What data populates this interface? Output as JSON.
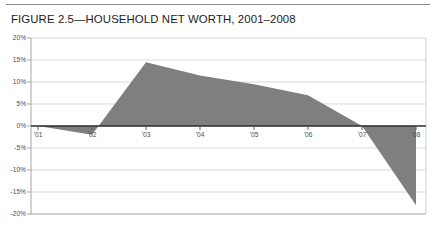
{
  "figure": {
    "title": "FIGURE 2.5—HOUSEHOLD NET WORTH, 2001–2008"
  },
  "colors": {
    "area_fill": "#7f7f7f",
    "zero_axis": "#2b2b2b",
    "gridline": "#d9d9d9",
    "axis_line": "#a6a6a6",
    "tick_text": "#4d4d4d",
    "title_text": "#1b1b1b",
    "top_rule": "#8a8a8a"
  },
  "chart_data": {
    "type": "area",
    "title": "FIGURE 2.5—HOUSEHOLD NET WORTH, 2001–2008",
    "xlabel": "",
    "ylabel": "",
    "grid": true,
    "legend": "none",
    "xlim": [
      "'01",
      "'08"
    ],
    "ylim": [
      -20,
      20
    ],
    "ytick_labels": [
      "20%",
      "15%",
      "10%",
      "5%",
      "0%",
      "-5%",
      "-10%",
      "-15%",
      "-20%"
    ],
    "ytick_values": [
      20,
      15,
      10,
      5,
      0,
      -5,
      -10,
      -15,
      -20
    ],
    "xtick_labels": [
      "'01",
      "'02",
      "'03",
      "'04",
      "'05",
      "'06",
      "'07",
      "'08"
    ],
    "categories": [
      "'01",
      "'02",
      "'03",
      "'04",
      "'05",
      "'06",
      "'07",
      "'08"
    ],
    "values": [
      0,
      -2,
      14.5,
      11.5,
      9.5,
      7,
      0,
      -18
    ],
    "series": [
      {
        "name": "Household net worth change",
        "points": [
          {
            "x": "'01",
            "y": 0
          },
          {
            "x": "'02",
            "y": -2
          },
          {
            "x": "'03",
            "y": 14.5
          },
          {
            "x": "'04",
            "y": 11.5
          },
          {
            "x": "'05",
            "y": 9.5
          },
          {
            "x": "'06",
            "y": 7
          },
          {
            "x": "'07",
            "y": 0
          },
          {
            "x": "'08",
            "y": -18
          }
        ]
      }
    ],
    "zero_crossings": [
      "'01",
      "between '02 and '03",
      "'07"
    ]
  }
}
